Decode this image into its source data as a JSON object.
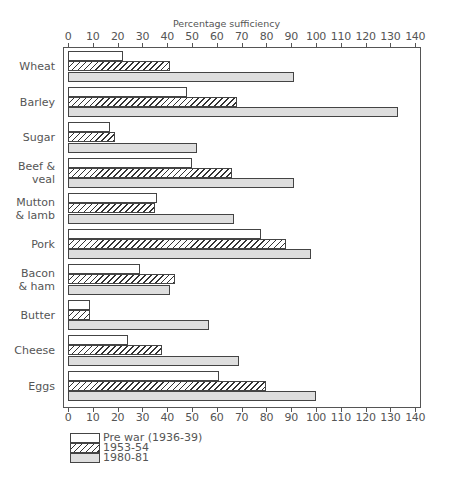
{
  "chart_data": {
    "type": "bar",
    "orientation": "horizontal",
    "title": "",
    "xlabel": "Percentage sufficiency",
    "ylabel": "",
    "xlim": [
      0,
      140
    ],
    "xticks": [
      0,
      10,
      20,
      30,
      40,
      50,
      60,
      70,
      80,
      90,
      100,
      110,
      120,
      130,
      140
    ],
    "grid": false,
    "legend_position": "bottom-left",
    "categories": [
      [
        "Wheat"
      ],
      [
        "Barley"
      ],
      [
        "Sugar"
      ],
      [
        "Beef &",
        "veal"
      ],
      [
        "Mutton",
        "& lamb"
      ],
      [
        "Pork"
      ],
      [
        "Bacon",
        "& ham"
      ],
      [
        "Butter"
      ],
      [
        "Cheese"
      ],
      [
        "Eggs"
      ]
    ],
    "category_names": [
      "Wheat",
      "Barley",
      "Sugar",
      "Beef & veal",
      "Mutton & lamb",
      "Pork",
      "Bacon & ham",
      "Butter",
      "Cheese",
      "Eggs"
    ],
    "series": [
      {
        "name": "Pre war (1936-39)",
        "pattern": "plain",
        "values": [
          22,
          48,
          17,
          50,
          36,
          78,
          29,
          9,
          24,
          61
        ]
      },
      {
        "name": "1953-54",
        "pattern": "hatched",
        "values": [
          41,
          68,
          19,
          66,
          35,
          88,
          43,
          9,
          38,
          80
        ]
      },
      {
        "name": "1980-81",
        "pattern": "stippled",
        "values": [
          91,
          133,
          52,
          91,
          67,
          98,
          41,
          57,
          69,
          100
        ]
      }
    ]
  },
  "axis": {
    "title": "Percentage sufficiency"
  },
  "legend": {
    "items": [
      {
        "label": "Pre war (1936-39)",
        "cls": "prewar"
      },
      {
        "label": "1953-54",
        "cls": "mid"
      },
      {
        "label": "1980-81",
        "cls": "recent"
      }
    ]
  },
  "colors": {
    "outline": "#444444",
    "stipple": "#dedede",
    "text": "#555555"
  }
}
